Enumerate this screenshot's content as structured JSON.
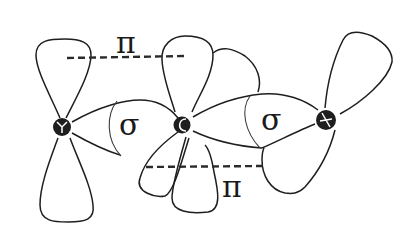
{
  "diagram": {
    "title": "",
    "molecule": "CO2",
    "atoms": [
      {
        "id": "O1",
        "symbol": "O",
        "position": "left"
      },
      {
        "id": "C",
        "symbol": "C",
        "position": "center"
      },
      {
        "id": "O2",
        "symbol": "O",
        "position": "right"
      }
    ],
    "labels": {
      "pi_top": "π",
      "pi_bottom": "π",
      "sigma_left": "σ",
      "sigma_right": "σ",
      "atom_left": "O",
      "atom_center": "C",
      "atom_right": "O"
    },
    "bonds": [
      {
        "type": "sigma",
        "between": [
          "O1",
          "C"
        ],
        "label": "σ"
      },
      {
        "type": "sigma",
        "between": [
          "C",
          "O2"
        ],
        "label": "σ"
      },
      {
        "type": "pi",
        "between": [
          "O1",
          "C"
        ],
        "label": "π",
        "orientation": "top"
      },
      {
        "type": "pi",
        "between": [
          "C",
          "O2"
        ],
        "label": "π",
        "orientation": "bottom"
      }
    ],
    "colors": {
      "stroke": "#1e1e1e",
      "background": "#ffffff"
    }
  }
}
